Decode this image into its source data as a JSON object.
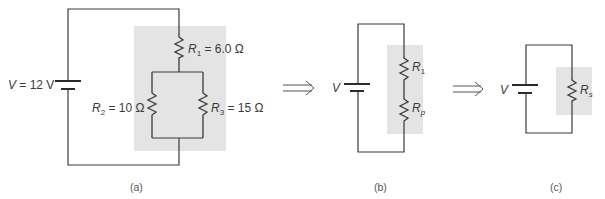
{
  "figure": {
    "panels": [
      {
        "id": "a",
        "caption": "(a)",
        "battery": {
          "symbol": "V",
          "eq": " = 12 V"
        },
        "resistors": [
          {
            "symbol": "R",
            "sub": "1",
            "eq": " = 6.0 Ω"
          },
          {
            "symbol": "R",
            "sub": "2",
            "eq": " = 10 Ω"
          },
          {
            "symbol": "R",
            "sub": "3",
            "eq": " = 15 Ω"
          }
        ]
      },
      {
        "id": "b",
        "caption": "(b)",
        "battery": {
          "symbol": "V"
        },
        "resistors": [
          {
            "symbol": "R",
            "sub": "1"
          },
          {
            "symbol": "R",
            "sub": "p"
          }
        ]
      },
      {
        "id": "c",
        "caption": "(c)",
        "battery": {
          "symbol": "V"
        },
        "resistors": [
          {
            "symbol": "R",
            "sub": "s"
          }
        ]
      }
    ],
    "arrows": [
      "implies-arrow",
      "implies-arrow"
    ],
    "colors": {
      "wire": "#3a3a3a",
      "shade": "#e4e4e4",
      "text": "#3a3a3a"
    }
  }
}
